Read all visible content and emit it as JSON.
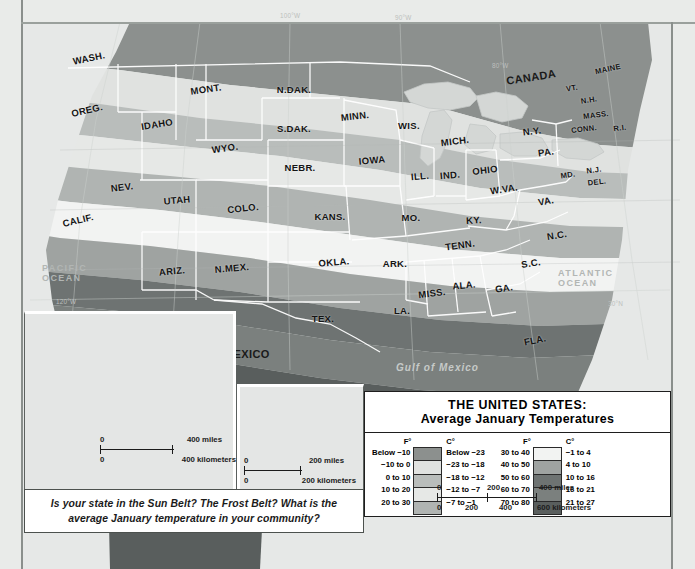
{
  "map": {
    "title_line1": "THE UNITED STATES:",
    "title_line2": "Average January Temperatures",
    "question": "Is your state in the Sun Belt? The Frost Belt? What is the average January temperature in your community?",
    "countries": [
      {
        "name": "CANADA",
        "label": "CANADA",
        "x": 508,
        "y": 78
      },
      {
        "name": "MEXICO",
        "label": "MEXICO",
        "x": 227,
        "y": 355
      },
      {
        "name": "CANADA-inset",
        "label": "CANADA",
        "x": 144,
        "y": 377
      },
      {
        "name": "USSR",
        "label": "U.S.S.R.",
        "x": 27,
        "y": 351
      },
      {
        "name": "ALASKA",
        "label": "ALASKA",
        "x": 89,
        "y": 358
      },
      {
        "name": "HAWAII",
        "label": "HAWAII",
        "x": 276,
        "y": 446
      }
    ],
    "oceans": [
      {
        "label": "PACIFIC\nOCEAN",
        "line1": "PACIFIC",
        "line2": "OCEAN",
        "x": 44,
        "y": 270
      },
      {
        "label": "ATLANTIC\nOCEAN",
        "line1": "ATLANTIC",
        "line2": "OCEAN",
        "x": 563,
        "y": 274
      },
      {
        "label": "Gulf of Mexico",
        "line1": "Gulf of Mexico",
        "line2": "",
        "x": 400,
        "y": 367
      },
      {
        "label": "PACIFIC OCEAN-alaska",
        "line1": "PACIFIC OCEAN",
        "line2": "",
        "x": 92,
        "y": 318
      },
      {
        "label": "PACIFIC OCEAN-hawaii",
        "line1": "PACIFIC OCEAN",
        "line2": "",
        "x": 268,
        "y": 410
      }
    ],
    "states": [
      {
        "abbr": "WASH.",
        "x": 89,
        "y": 58,
        "rot": -12,
        "size": "n"
      },
      {
        "abbr": "OREG.",
        "x": 87,
        "y": 110,
        "rot": -13,
        "size": "n"
      },
      {
        "abbr": "IDAHO",
        "x": 157,
        "y": 124,
        "rot": -9,
        "size": "n"
      },
      {
        "abbr": "MONT.",
        "x": 206,
        "y": 89,
        "rot": -8,
        "size": "n"
      },
      {
        "abbr": "N.DAK.",
        "x": 294,
        "y": 89,
        "rot": 0,
        "size": "n"
      },
      {
        "abbr": "S.DAK.",
        "x": 294,
        "y": 128,
        "rot": 0,
        "size": "n"
      },
      {
        "abbr": "MINN.",
        "x": 355,
        "y": 116,
        "rot": -6,
        "size": "n"
      },
      {
        "abbr": "WIS.",
        "x": 409,
        "y": 125,
        "rot": 0,
        "size": "n"
      },
      {
        "abbr": "MICH.",
        "x": 455,
        "y": 141,
        "rot": -7,
        "size": "n"
      },
      {
        "abbr": "WYO.",
        "x": 225,
        "y": 148,
        "rot": -8,
        "size": "n"
      },
      {
        "abbr": "NEBR.",
        "x": 300,
        "y": 167,
        "rot": 0,
        "size": "n"
      },
      {
        "abbr": "IOWA",
        "x": 372,
        "y": 160,
        "rot": -5,
        "size": "n"
      },
      {
        "abbr": "ILL.",
        "x": 420,
        "y": 176,
        "rot": -5,
        "size": "n"
      },
      {
        "abbr": "IND.",
        "x": 450,
        "y": 175,
        "rot": -5,
        "size": "n"
      },
      {
        "abbr": "OHIO",
        "x": 485,
        "y": 170,
        "rot": -7,
        "size": "n"
      },
      {
        "abbr": "PA.",
        "x": 546,
        "y": 152,
        "rot": -8,
        "size": "n"
      },
      {
        "abbr": "N.Y.",
        "x": 532,
        "y": 131,
        "rot": -7,
        "size": "n"
      },
      {
        "abbr": "VT.",
        "x": 572,
        "y": 88,
        "rot": -9,
        "size": "sm"
      },
      {
        "abbr": "N.H.",
        "x": 589,
        "y": 100,
        "rot": -9,
        "size": "sm"
      },
      {
        "abbr": "MAINE",
        "x": 608,
        "y": 69,
        "rot": -12,
        "size": "sm"
      },
      {
        "abbr": "MASS.",
        "x": 596,
        "y": 115,
        "rot": -7,
        "size": "sm"
      },
      {
        "abbr": "CONN.",
        "x": 584,
        "y": 129,
        "rot": -7,
        "size": "sm"
      },
      {
        "abbr": "R.I.",
        "x": 620,
        "y": 128,
        "rot": -7,
        "size": "sm"
      },
      {
        "abbr": "N.J.",
        "x": 594,
        "y": 170,
        "rot": -7,
        "size": "sm"
      },
      {
        "abbr": "DEL.",
        "x": 597,
        "y": 182,
        "rot": -7,
        "size": "sm"
      },
      {
        "abbr": "MD.",
        "x": 568,
        "y": 175,
        "rot": -8,
        "size": "sm"
      },
      {
        "abbr": "W.VA.",
        "x": 504,
        "y": 189,
        "rot": -9,
        "size": "n"
      },
      {
        "abbr": "VA.",
        "x": 546,
        "y": 201,
        "rot": -10,
        "size": "n"
      },
      {
        "abbr": "N.C.",
        "x": 557,
        "y": 235,
        "rot": -9,
        "size": "n"
      },
      {
        "abbr": "S.C.",
        "x": 531,
        "y": 263,
        "rot": -9,
        "size": "n"
      },
      {
        "abbr": "GA.",
        "x": 504,
        "y": 288,
        "rot": -9,
        "size": "n"
      },
      {
        "abbr": "FLA.",
        "x": 535,
        "y": 340,
        "rot": -11,
        "size": "n"
      },
      {
        "abbr": "ALA.",
        "x": 464,
        "y": 285,
        "rot": -5,
        "size": "n"
      },
      {
        "abbr": "MISS.",
        "x": 432,
        "y": 293,
        "rot": -7,
        "size": "n"
      },
      {
        "abbr": "TENN.",
        "x": 460,
        "y": 245,
        "rot": -8,
        "size": "n"
      },
      {
        "abbr": "KY.",
        "x": 474,
        "y": 220,
        "rot": -3,
        "size": "n"
      },
      {
        "abbr": "ARK.",
        "x": 395,
        "y": 263,
        "rot": 0,
        "size": "n"
      },
      {
        "abbr": "LA.",
        "x": 402,
        "y": 310,
        "rot": 0,
        "size": "n"
      },
      {
        "abbr": "MO.",
        "x": 411,
        "y": 217,
        "rot": 0,
        "size": "n"
      },
      {
        "abbr": "KANS.",
        "x": 330,
        "y": 216,
        "rot": 0,
        "size": "n"
      },
      {
        "abbr": "OKLA.",
        "x": 334,
        "y": 262,
        "rot": -5,
        "size": "n"
      },
      {
        "abbr": "TEX.",
        "x": 323,
        "y": 318,
        "rot": 0,
        "size": "n"
      },
      {
        "abbr": "COLO.",
        "x": 243,
        "y": 208,
        "rot": -6,
        "size": "n"
      },
      {
        "abbr": "N.MEX.",
        "x": 232,
        "y": 268,
        "rot": -5,
        "size": "n"
      },
      {
        "abbr": "ARIZ.",
        "x": 172,
        "y": 271,
        "rot": -6,
        "size": "n"
      },
      {
        "abbr": "UTAH",
        "x": 177,
        "y": 200,
        "rot": -5,
        "size": "n"
      },
      {
        "abbr": "NEV.",
        "x": 122,
        "y": 187,
        "rot": -7,
        "size": "n"
      },
      {
        "abbr": "CALIF.",
        "x": 78,
        "y": 220,
        "rot": -13,
        "size": "n"
      }
    ],
    "grid_labels": [
      {
        "text": "120°W",
        "x": 56,
        "y": 298
      },
      {
        "text": "110°W",
        "x": 168,
        "y": 320
      },
      {
        "text": "100°W",
        "x": 280,
        "y": 12
      },
      {
        "text": "90°W",
        "x": 395,
        "y": 14
      },
      {
        "text": "80°W",
        "x": 492,
        "y": 62
      },
      {
        "text": "30°N",
        "x": 608,
        "y": 300
      },
      {
        "text": "170°W",
        "x": 46,
        "y": 318
      },
      {
        "text": "160°W",
        "x": 48,
        "y": 482
      },
      {
        "text": "150°W",
        "x": 113,
        "y": 483
      },
      {
        "text": "140°W",
        "x": 178,
        "y": 483
      },
      {
        "text": "60°N",
        "x": 110,
        "y": 330
      },
      {
        "text": "160°W",
        "x": 247,
        "y": 394
      },
      {
        "text": "155°W",
        "x": 335,
        "y": 483
      },
      {
        "text": "20°N",
        "x": 337,
        "y": 444
      }
    ],
    "scalebars": [
      {
        "name": "alaska-scale",
        "miles_zero": "0",
        "miles_label": "400 miles",
        "km_zero": "0",
        "km_label": "400 kilometers"
      },
      {
        "name": "hawaii-scale",
        "miles_zero": "0",
        "miles_label": "200 miles",
        "km_zero": "0",
        "km_label": "200 kilometers"
      },
      {
        "name": "main-scale",
        "miles_ticks": [
          "0",
          "200",
          "400 miles"
        ],
        "km_ticks": [
          "0",
          "200",
          "400",
          "600 kilometers"
        ]
      }
    ]
  },
  "legend": {
    "col_header_f": "F°",
    "col_header_c": "C°",
    "left_column": [
      {
        "f": "Below −10",
        "c": "Below −23",
        "color": "#8c908e"
      },
      {
        "f": "−10 to 0",
        "c": "−23 to −18",
        "color": "#e0e2e0"
      },
      {
        "f": "0 to 10",
        "c": "−18 to −12",
        "color": "#b9bdbb"
      },
      {
        "f": "10 to 20",
        "c": "−12 to −7",
        "color": "#e6e8e6"
      },
      {
        "f": "20 to 30",
        "c": "−7 to −1",
        "color": "#b0b4b2"
      }
    ],
    "right_column": [
      {
        "f": "30 to 40",
        "c": "−1 to 4",
        "color": "#f2f3f2"
      },
      {
        "f": "40 to 50",
        "c": "4 to 10",
        "color": "#9fa3a1"
      },
      {
        "f": "50 to 60",
        "c": "10 to 16",
        "color": "#6e7372"
      },
      {
        "f": "60 to 70",
        "c": "16 to 21",
        "color": "#7b807e"
      },
      {
        "f": "70 to 80",
        "c": "21 to 27",
        "color": "#595e5d"
      }
    ],
    "scale_miles": [
      "0",
      "200",
      "400 miles"
    ],
    "scale_km": [
      "0",
      "200",
      "400",
      "600 kilometers"
    ]
  }
}
